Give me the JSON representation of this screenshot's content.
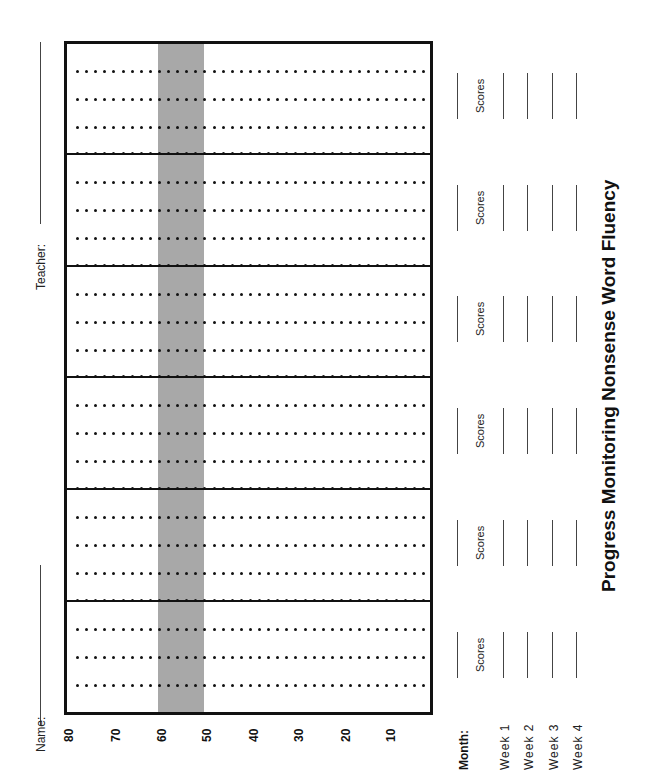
{
  "orientation": "rotated-90-ccw",
  "header": {
    "name_label": "Name:",
    "teacher_label": "Teacher:"
  },
  "title": "Progress Monitoring Nonsense Word Fluency",
  "chart": {
    "y_axis_ticks": [
      "80",
      "70",
      "60",
      "50",
      "40",
      "30",
      "20",
      "10"
    ],
    "target_band": {
      "from": 50,
      "to": 60,
      "color": "#a8a8a8"
    },
    "months_count": 6,
    "weeks_per_month": 4
  },
  "table": {
    "month_label": "Month:",
    "week_labels": [
      "Week 1",
      "Week 2",
      "Week 3",
      "Week 4"
    ],
    "scores_label": "Scores",
    "blocks": [
      {
        "scores_label": "Scores"
      },
      {
        "scores_label": "Scores"
      },
      {
        "scores_label": "Scores"
      },
      {
        "scores_label": "Scores"
      },
      {
        "scores_label": "Scores"
      },
      {
        "scores_label": "Scores"
      }
    ]
  },
  "chart_data": {
    "type": "table",
    "title": "Progress Monitoring Nonsense Word Fluency",
    "xlabel": "Month / Week",
    "ylabel": "",
    "ylim": [
      0,
      80
    ],
    "y_ticks": [
      80,
      70,
      60,
      50,
      40,
      30,
      20,
      10
    ],
    "grid": true,
    "shaded_band": [
      50,
      60
    ],
    "categories": [
      "Month 1 (Weeks 1-4)",
      "Month 2 (Weeks 1-4)",
      "Month 3 (Weeks 1-4)",
      "Month 4 (Weeks 1-4)",
      "Month 5 (Weeks 1-4)",
      "Month 6 (Weeks 1-4)"
    ],
    "series": [],
    "note": "Blank progress-monitoring template; no data points plotted."
  }
}
